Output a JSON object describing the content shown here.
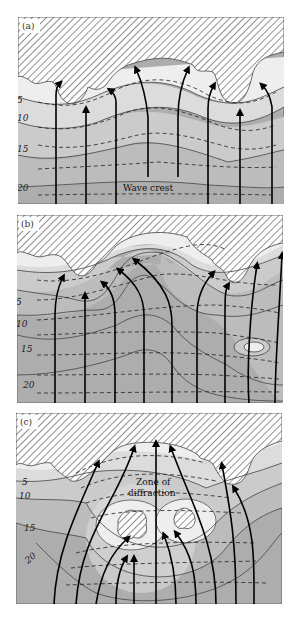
{
  "figure": {
    "panels": [
      {
        "label": "(a)",
        "depth_labels": [
          "5",
          "10",
          "15",
          "20"
        ],
        "annotation": "Wave crest"
      },
      {
        "label": "(b)",
        "depth_labels": [
          "5",
          "10",
          "15",
          "20"
        ]
      },
      {
        "label": "(c)",
        "depth_labels": [
          "5",
          "10",
          "15",
          "20"
        ],
        "annotation_line1": "Zone of",
        "annotation_line2": "diffraction"
      }
    ],
    "colors": {
      "land_hatch": "#555555",
      "shallow": "#eeeeee",
      "depth_5": "#dcdcdc",
      "depth_10": "#cbcbcb",
      "depth_15": "#bcbcbc",
      "depth_20": "#adadad",
      "orthogonal": "#000000"
    }
  }
}
